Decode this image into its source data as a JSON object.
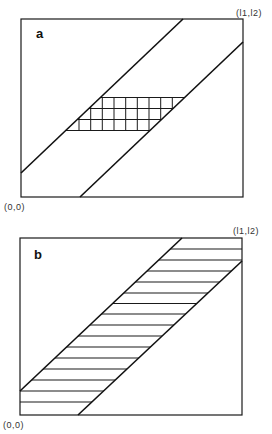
{
  "panels": [
    {
      "id": "a",
      "label": "a",
      "origin_label": "(0,0)",
      "corner_label": "(l1,l2)",
      "box": {
        "x": 21,
        "y": 19,
        "w": 222,
        "h": 178
      },
      "band": {
        "upper_line": [
          [
            21,
            173
          ],
          [
            183,
            19
          ]
        ],
        "lower_line": [
          [
            80,
            197
          ],
          [
            243,
            42
          ]
        ]
      },
      "fill_pattern": "grid",
      "grid_rows_y": [
        97.5,
        108.5,
        119.5,
        130.5
      ],
      "grid_cols_x": [
        79,
        90.7,
        102.3,
        114,
        125.7,
        137.3,
        149,
        160.7,
        172.3
      ]
    },
    {
      "id": "b",
      "label": "b",
      "origin_label": "(0,0)",
      "corner_label": "(l1,l2)",
      "box": {
        "x": 20,
        "y": 238,
        "w": 222,
        "h": 177
      },
      "band": {
        "upper_line": [
          [
            20,
            391
          ],
          [
            182,
            238
          ]
        ],
        "lower_line": [
          [
            78,
            415
          ],
          [
            242,
            261
          ]
        ]
      },
      "fill_pattern": "horizontal-hatch",
      "hatch_rows_y": [
        249,
        260,
        271,
        282,
        293,
        303.5,
        314,
        325,
        336,
        347,
        358,
        369,
        380,
        391,
        402
      ]
    }
  ],
  "colors": {
    "line": "#111111",
    "background": "#ffffff",
    "label": "#333333"
  }
}
